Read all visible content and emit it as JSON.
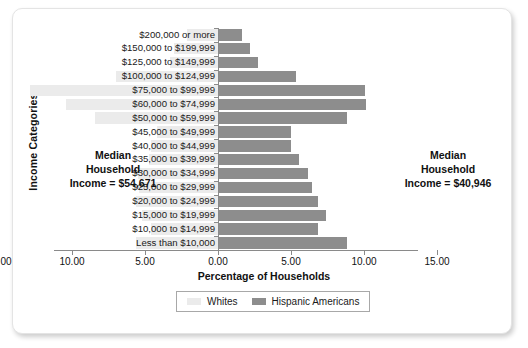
{
  "chart_data": {
    "type": "bar",
    "orientation": "horizontal-diverging",
    "title": "",
    "xlabel": "Percentage of Households",
    "ylabel": "Income Categories",
    "xticks": [
      "15.00",
      "10.00",
      "5.00",
      "0.00",
      "5.00",
      "10.00",
      "15.00"
    ],
    "xlim": [
      0,
      15
    ],
    "grid": false,
    "legend_position": "bottom",
    "categories": [
      "$200,000 or more",
      "$150,000 to $199,999",
      "$125,000 to $149,999",
      "$100,000 to $124,999",
      "$75,000 to $99,999",
      "$60,000 to $74,999",
      "$50,000 to $59,999",
      "$45,000 to $49,999",
      "$40,000 to $44,999",
      "$35,000 to $39,999",
      "$30,000 to $34,999",
      "$25,000 to $29,999",
      "$20,000 to $24,999",
      "$15,000 to $19,999",
      "$10,000 to $14,999",
      "Less than $10,000"
    ],
    "series": [
      {
        "name": "Whites",
        "side": "left",
        "color": "#ebebeb",
        "values": [
          2.1,
          3.0,
          3.3,
          7.0,
          12.9,
          10.4,
          8.4,
          4.2,
          4.6,
          4.7,
          5.5,
          5.4,
          5.6,
          5.2,
          4.6,
          5.6
        ]
      },
      {
        "name": "Hispanic Americans",
        "side": "right",
        "color": "#8d8d8d",
        "values": [
          1.6,
          2.1,
          2.7,
          5.3,
          10.0,
          10.1,
          8.8,
          4.9,
          4.9,
          5.5,
          6.1,
          6.4,
          6.8,
          7.3,
          6.8,
          8.8
        ]
      }
    ],
    "annotations": [
      {
        "id": "median-whites",
        "lines": [
          "Median",
          "Household",
          "Income = $54,671"
        ]
      },
      {
        "id": "median-hispanic",
        "lines": [
          "Median",
          "Household",
          "Income = $40,946"
        ]
      }
    ]
  },
  "legend": {
    "items": [
      {
        "label": "Whites",
        "color": "#ebebeb"
      },
      {
        "label": "Hispanic Americans",
        "color": "#8d8d8d"
      }
    ]
  },
  "annotation_left": {
    "line1": "Median",
    "line2": "Household",
    "line3": "Income = $54,671"
  },
  "annotation_right": {
    "line1": "Median",
    "line2": "Household",
    "line3": "Income = $40,946"
  }
}
